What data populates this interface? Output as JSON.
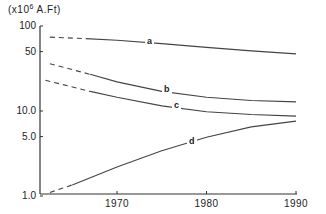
{
  "chart_data": {
    "type": "line",
    "title": "",
    "ylabel": "(x10^6 A.Ft)",
    "unit_prefix": "(x10",
    "unit_exp": "6",
    "unit_suffix": " A.Ft)",
    "xlabel": "",
    "yscale": "log",
    "ylim": [
      1.0,
      100
    ],
    "xlim": [
      1962,
      1990
    ],
    "grid": false,
    "legend": "inline labels",
    "y_ticks": [
      "100",
      "50",
      "10.0",
      "5.0",
      "1.0"
    ],
    "x_ticks": [
      "1970",
      "1980",
      "1990"
    ],
    "series": [
      {
        "name": "a",
        "x": [
          1962.5,
          1966.5,
          1970,
          1975,
          1980,
          1985,
          1990
        ],
        "values": [
          74,
          71,
          68,
          62,
          56,
          51,
          47
        ],
        "dashed_until": 1966.5
      },
      {
        "name": "b",
        "x": [
          1962.5,
          1967,
          1970,
          1975,
          1980,
          1985,
          1990
        ],
        "values": [
          36,
          27,
          22,
          17,
          14.5,
          13.3,
          12.8
        ],
        "dashed_until": 1967
      },
      {
        "name": "c",
        "x": [
          1962,
          1967,
          1970,
          1975,
          1980,
          1985,
          1990
        ],
        "values": [
          23,
          17,
          14.5,
          11.5,
          9.8,
          9.1,
          8.7
        ],
        "dashed_until": 1967
      },
      {
        "name": "d",
        "x": [
          1962.5,
          1965,
          1970,
          1975,
          1980,
          1985,
          1990
        ],
        "values": [
          1.1,
          1.35,
          2.2,
          3.4,
          4.9,
          6.5,
          7.6
        ],
        "dashed_until": 1965
      }
    ]
  }
}
